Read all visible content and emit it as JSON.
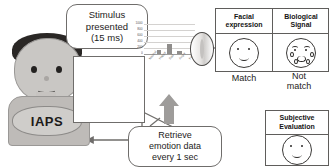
{
  "diagram": {
    "bubbles": {
      "stimulus": {
        "line1": "Stimulus",
        "line2": "presented",
        "line3": "(15 ms)"
      },
      "retrieve": {
        "line1": "Retrieve",
        "line2": "emotion data",
        "line3": "every 1 sec"
      }
    },
    "subject": {
      "badge_label": "IAPS"
    },
    "panels": {
      "facial": {
        "head_line1": "Facial",
        "head_line2": "expression",
        "verdict": "Match"
      },
      "biological": {
        "head_line1": "Biological",
        "head_line2": "Signal",
        "verdict_line1": "Not",
        "verdict_line2": "match"
      },
      "subjective": {
        "head_line1": "Subjective",
        "head_line2": "Evaluation"
      }
    },
    "icons": {
      "lens": "camera-lens-icon",
      "up_arrow": "thick-up-arrow-icon"
    }
  },
  "chart_data": {
    "type": "bar",
    "title": "",
    "xlabel": "",
    "ylabel": "",
    "categories": [
      "Neutral",
      "Happy",
      "Sad",
      "Angry",
      "Fear"
    ],
    "values": [
      0,
      140,
      320,
      90,
      0
    ],
    "ylim": [
      0,
      1000
    ],
    "yticks": [
      0,
      200,
      400,
      600,
      800,
      1000
    ],
    "ytick_labels": [
      "0",
      "200",
      "400",
      "600",
      "800",
      "1000"
    ],
    "grid": true,
    "legend": "none"
  }
}
